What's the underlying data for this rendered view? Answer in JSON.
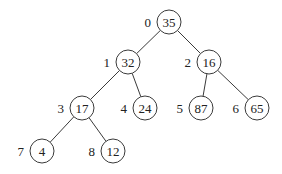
{
  "diagram": {
    "type": "binary-heap-tree",
    "radius": 12,
    "nodes": [
      {
        "index": "0",
        "value": "35",
        "x": 169,
        "y": 22
      },
      {
        "index": "1",
        "value": "32",
        "x": 128,
        "y": 62
      },
      {
        "index": "2",
        "value": "16",
        "x": 209,
        "y": 62
      },
      {
        "index": "3",
        "value": "17",
        "x": 82,
        "y": 108
      },
      {
        "index": "4",
        "value": "24",
        "x": 145,
        "y": 108
      },
      {
        "index": "5",
        "value": "87",
        "x": 201,
        "y": 108
      },
      {
        "index": "6",
        "value": "65",
        "x": 257,
        "y": 108
      },
      {
        "index": "7",
        "value": "4",
        "x": 42,
        "y": 151
      },
      {
        "index": "8",
        "value": "12",
        "x": 113,
        "y": 151
      }
    ],
    "edges": [
      [
        0,
        1
      ],
      [
        0,
        2
      ],
      [
        1,
        3
      ],
      [
        1,
        4
      ],
      [
        2,
        5
      ],
      [
        2,
        6
      ],
      [
        3,
        7
      ],
      [
        3,
        8
      ]
    ]
  }
}
